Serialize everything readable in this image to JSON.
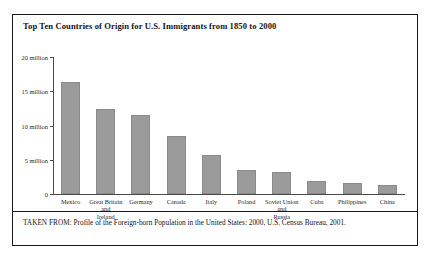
{
  "figure": {
    "title": "Top Ten Countries of Origin for U.S. Immigrants from 1850 to 2000",
    "caption": "TAKEN FROM: Profile of the Foreign-born Population in the United States: 2000, U.S. Census Bureau, 2001."
  },
  "chart_data": {
    "type": "bar",
    "title": "Top Ten Countries of Origin for U.S. Immigrants from 1850 to 2000",
    "xlabel": "",
    "ylabel": "",
    "ylim": [
      0,
      20000000
    ],
    "grid": false,
    "legend": null,
    "bar_color": "#9b9b9b",
    "ytick_values": [
      0,
      5000000,
      10000000,
      15000000,
      20000000
    ],
    "ytick_labels": [
      "0",
      "5 million",
      "10 million",
      "15 million",
      "20 million"
    ],
    "categories": [
      "Mexico",
      "Great Britain and Ireland",
      "Germany",
      "Canada",
      "Italy",
      "Poland",
      "Soviet Union and Russia",
      "China",
      "Cuba",
      "Philippines"
    ],
    "categories_display": [
      "Mexico",
      "Great Britain\nand\nIreland",
      "Germany",
      "Canada",
      "Italy",
      "Poland",
      "Soviet Union\nand\nRussia",
      "Cuba",
      "Philippines",
      "China"
    ],
    "values": [
      16400000,
      12400000,
      11600000,
      8400000,
      5700000,
      3500000,
      3200000,
      1900000,
      1600000,
      1300000
    ]
  },
  "axis": {
    "ticks": [
      {
        "label": "20 million",
        "value": 20000000
      },
      {
        "label": "15 million",
        "value": 15000000
      },
      {
        "label": "10 million",
        "value": 10000000
      },
      {
        "label": "5 million",
        "value": 5000000
      },
      {
        "label": "0",
        "value": 0
      }
    ]
  },
  "bars": [
    {
      "label_line1": "Mexico",
      "label_line2": "",
      "label_line3": "",
      "value": 16400000
    },
    {
      "label_line1": "Great Britain",
      "label_line2": "and",
      "label_line3": "Ireland",
      "value": 12400000
    },
    {
      "label_line1": "Germany",
      "label_line2": "",
      "label_line3": "",
      "value": 11600000
    },
    {
      "label_line1": "Canada",
      "label_line2": "",
      "label_line3": "",
      "value": 8400000
    },
    {
      "label_line1": "Italy",
      "label_line2": "",
      "label_line3": "",
      "value": 5700000
    },
    {
      "label_line1": "Poland",
      "label_line2": "",
      "label_line3": "",
      "value": 3500000
    },
    {
      "label_line1": "Soviet Union",
      "label_line2": "and",
      "label_line3": "Russia",
      "value": 3200000
    },
    {
      "label_line1": "Cuba",
      "label_line2": "",
      "label_line3": "",
      "value": 1900000
    },
    {
      "label_line1": "Philippines",
      "label_line2": "",
      "label_line3": "",
      "value": 1600000
    },
    {
      "label_line1": "China",
      "label_line2": "",
      "label_line3": "",
      "value": 1300000
    }
  ]
}
